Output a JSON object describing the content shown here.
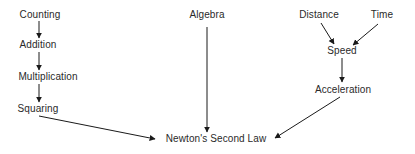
{
  "diagram": {
    "type": "concept-dependency-graph",
    "nodes": {
      "counting": {
        "label": "Counting",
        "x": 40,
        "y": 15
      },
      "addition": {
        "label": "Addition",
        "x": 38,
        "y": 45
      },
      "multiplication": {
        "label": "Multiplication",
        "x": 48,
        "y": 78
      },
      "squaring": {
        "label": "Squaring",
        "x": 38,
        "y": 109
      },
      "algebra": {
        "label": "Algebra",
        "x": 207,
        "y": 15
      },
      "newton": {
        "label": "Newton's Second Law",
        "x": 216,
        "y": 139
      },
      "distance": {
        "label": "Distance",
        "x": 319,
        "y": 15
      },
      "time": {
        "label": "Time",
        "x": 382,
        "y": 15
      },
      "speed": {
        "label": "Speed",
        "x": 335,
        "y": 51
      },
      "acceleration": {
        "label": "Acceleration",
        "x": 343,
        "y": 90
      }
    },
    "edges": [
      {
        "from": "counting",
        "to": "addition"
      },
      {
        "from": "addition",
        "to": "multiplication"
      },
      {
        "from": "multiplication",
        "to": "squaring"
      },
      {
        "from": "squaring",
        "to": "newton"
      },
      {
        "from": "algebra",
        "to": "newton"
      },
      {
        "from": "distance",
        "to": "speed"
      },
      {
        "from": "time",
        "to": "speed"
      },
      {
        "from": "speed",
        "to": "acceleration"
      },
      {
        "from": "acceleration",
        "to": "newton"
      }
    ]
  }
}
